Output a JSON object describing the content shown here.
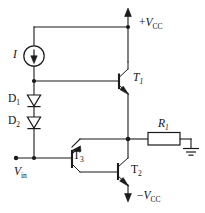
{
  "diagram": {
    "type": "electronic-circuit-schematic",
    "background_color": "#ffffff",
    "line_color": "#1a1a1a"
  },
  "labels": {
    "current_source": "I",
    "diode_1_name": "D",
    "diode_1_sub": "1",
    "diode_2_name": "D",
    "diode_2_sub": "2",
    "transistor_1_name": "T",
    "transistor_1_sub": "1",
    "transistor_2_name": "T",
    "transistor_2_sub": "2",
    "transistor_3_name": "T",
    "transistor_3_sub": "3",
    "resistor_name": "R",
    "resistor_sub": "1",
    "supply_positive_sign": "+",
    "supply_positive_name": "V",
    "supply_positive_sub": "CC",
    "supply_negative_sign": "−",
    "supply_negative_name": "V",
    "supply_negative_sub": "CC",
    "input_name": "V",
    "input_sub": "in"
  },
  "components": [
    {
      "id": "I",
      "type": "current-source",
      "label": "I",
      "direction": "down"
    },
    {
      "id": "D1",
      "type": "diode",
      "label": "D1",
      "direction": "down"
    },
    {
      "id": "D2",
      "type": "diode",
      "label": "D2",
      "direction": "down"
    },
    {
      "id": "T1",
      "type": "transistor-npn",
      "label": "T1"
    },
    {
      "id": "T2",
      "type": "transistor-npn",
      "label": "T2"
    },
    {
      "id": "T3",
      "type": "transistor-pnp",
      "label": "T3"
    },
    {
      "id": "R1",
      "type": "resistor",
      "label": "R1"
    },
    {
      "id": "GND",
      "type": "ground",
      "label": ""
    }
  ],
  "terminals": [
    {
      "id": "VCC_POS",
      "label": "+VCC",
      "position": "top-right"
    },
    {
      "id": "VCC_NEG",
      "label": "-VCC",
      "position": "bottom-center"
    },
    {
      "id": "VIN",
      "label": "Vin",
      "position": "left-lower"
    }
  ]
}
